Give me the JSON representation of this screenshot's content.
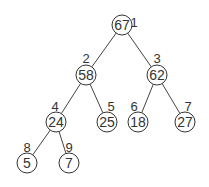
{
  "diagram": {
    "type": "binary-heap-tree",
    "nodes": [
      {
        "index": "1",
        "value": "67",
        "x": 122,
        "y": 25,
        "lx": 134,
        "ly": 22
      },
      {
        "index": "2",
        "value": "58",
        "x": 86,
        "y": 75,
        "lx": 86,
        "ly": 58
      },
      {
        "index": "3",
        "value": "62",
        "x": 157,
        "y": 75,
        "lx": 157,
        "ly": 58
      },
      {
        "index": "4",
        "value": "24",
        "x": 56,
        "y": 122,
        "lx": 55,
        "ly": 106
      },
      {
        "index": "5",
        "value": "25",
        "x": 107,
        "y": 122,
        "lx": 111,
        "ly": 106
      },
      {
        "index": "6",
        "value": "18",
        "x": 138,
        "y": 122,
        "lx": 134,
        "ly": 106
      },
      {
        "index": "7",
        "value": "27",
        "x": 185,
        "y": 122,
        "lx": 188,
        "ly": 106
      },
      {
        "index": "8",
        "value": "5",
        "x": 27,
        "y": 163,
        "lx": 27,
        "ly": 147
      },
      {
        "index": "9",
        "value": "7",
        "x": 69,
        "y": 163,
        "lx": 69,
        "ly": 147
      }
    ],
    "edges": [
      [
        0,
        1
      ],
      [
        0,
        2
      ],
      [
        1,
        3
      ],
      [
        1,
        4
      ],
      [
        2,
        5
      ],
      [
        2,
        6
      ],
      [
        3,
        7
      ],
      [
        3,
        8
      ]
    ]
  }
}
